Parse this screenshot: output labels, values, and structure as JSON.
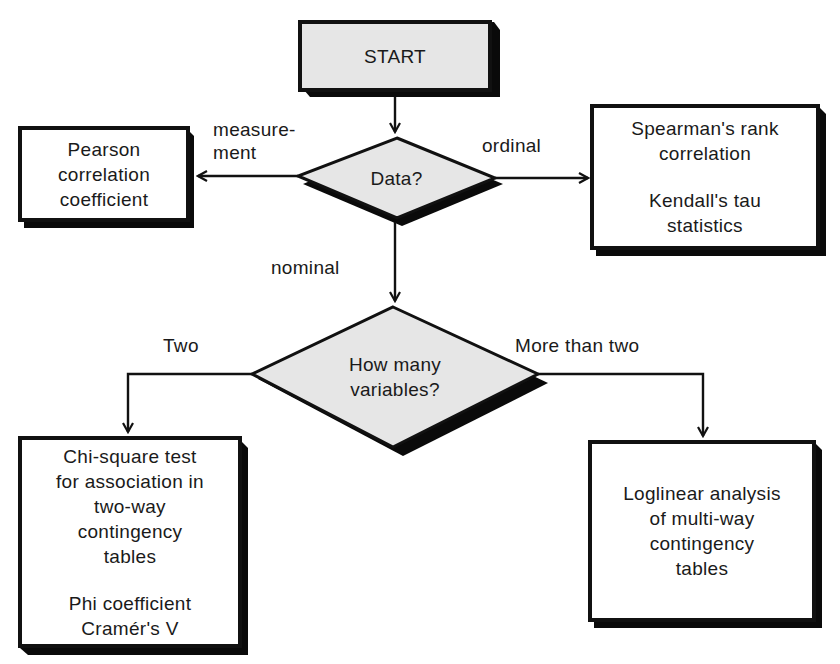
{
  "diagram": {
    "type": "flowchart",
    "colors": {
      "line": "#111111",
      "shadow": "#0a0a0a",
      "decision_fill": "#e6e6e6",
      "start_fill": "#e6e6e6",
      "box_fill": "#ffffff"
    },
    "nodes": {
      "start": {
        "label": "START"
      },
      "data_decision": {
        "label": "Data?"
      },
      "pearson": {
        "lines": [
          "Pearson",
          "correlation",
          "coefficient"
        ]
      },
      "spearman": {
        "group1": [
          "Spearman's rank",
          "correlation"
        ],
        "group2": [
          "Kendall's tau",
          "statistics"
        ]
      },
      "variables_decision": {
        "lines": [
          "How many",
          "variables?"
        ]
      },
      "chi_square": {
        "group1": [
          "Chi-square test",
          "for association in",
          "two-way",
          "contingency",
          "tables"
        ],
        "group2": [
          "Phi coefficient",
          "Cramér's V"
        ]
      },
      "loglinear": {
        "lines": [
          "Loglinear analysis",
          "of multi-way",
          "contingency",
          "tables"
        ]
      }
    },
    "edges": {
      "measurement": [
        "measure-",
        "ment"
      ],
      "ordinal": "ordinal",
      "nominal": "nominal",
      "two": "Two",
      "more_than_two": "More than two"
    }
  }
}
